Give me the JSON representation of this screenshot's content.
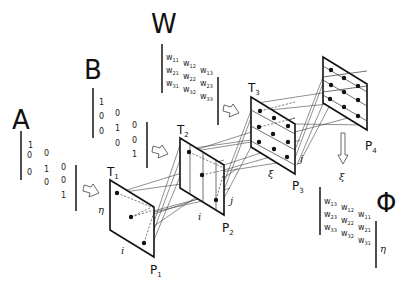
{
  "diagram": {
    "type": "optical/neural processing pipeline, perspective planes",
    "matrices": {
      "A": {
        "label": "A",
        "values": [
          [
            "1"
          ],
          [
            "0",
            "0"
          ],
          [
            "0",
            "1",
            "0"
          ],
          [
            "0",
            "0"
          ],
          [
            "1"
          ]
        ]
      },
      "B": {
        "label": "B",
        "values": [
          [
            "1"
          ],
          [
            "0",
            "0"
          ],
          [
            "0",
            "1",
            "0"
          ],
          [
            "0",
            "0"
          ],
          [
            "1"
          ]
        ]
      },
      "W": {
        "label": "W",
        "rows": [
          [
            {
              "b": "w",
              "s": "11"
            },
            {
              "b": "w",
              "s": "12"
            },
            {
              "b": "w",
              "s": "13"
            }
          ],
          [
            {
              "b": "w",
              "s": "21"
            },
            {
              "b": "w",
              "s": "22"
            },
            {
              "b": "w",
              "s": "23"
            }
          ],
          [
            {
              "b": "w",
              "s": "31"
            },
            {
              "b": "w",
              "s": "32"
            },
            {
              "b": "w",
              "s": "33"
            }
          ]
        ]
      },
      "Phi": {
        "label": "Φ",
        "rows": [
          [
            {
              "b": "w",
              "s": "13"
            },
            {
              "b": "w",
              "s": "12"
            },
            {
              "b": "w",
              "s": "11"
            }
          ],
          [
            {
              "b": "w",
              "s": "23"
            },
            {
              "b": "w",
              "s": "22"
            },
            {
              "b": "w",
              "s": "21"
            }
          ],
          [
            {
              "b": "w",
              "s": "33"
            },
            {
              "b": "w",
              "s": "32"
            },
            {
              "b": "w",
              "s": "31"
            }
          ]
        ]
      }
    },
    "planes": [
      {
        "id": "P1",
        "label_base": "P",
        "label_sub": "1",
        "top_label_base": "T",
        "top_label_sub": "1",
        "axis_bottom": "i",
        "axis_left": "η"
      },
      {
        "id": "P2",
        "label_base": "P",
        "label_sub": "2",
        "top_label_base": "T",
        "top_label_sub": "2",
        "axis_bottom": "i",
        "axis_right": "j"
      },
      {
        "id": "P3",
        "label_base": "P",
        "label_sub": "3",
        "top_label_base": "T",
        "top_label_sub": "3",
        "axis_bottom": "ξ",
        "axis_right": "j"
      },
      {
        "id": "P4",
        "label_base": "P",
        "label_sub": "4"
      }
    ],
    "output_axes": {
      "down_arrow_label": "ξ",
      "phi_side_label": "η"
    }
  }
}
